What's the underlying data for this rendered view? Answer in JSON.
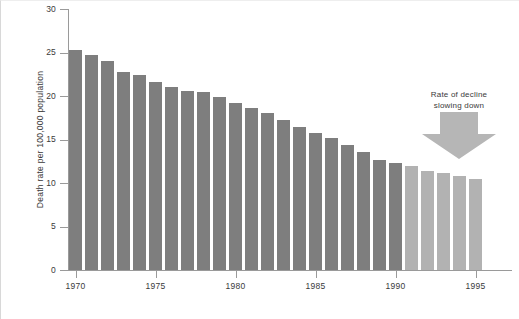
{
  "chart_data": {
    "type": "bar",
    "title": "",
    "xlabel": "",
    "ylabel": "Death rate per 100,000 population",
    "ylim": [
      0,
      30
    ],
    "yticks": [
      0,
      5,
      10,
      15,
      20,
      25,
      30
    ],
    "ytick_labels": [
      "0",
      "5",
      "10",
      "15",
      "20",
      "25",
      "30"
    ],
    "xticks": [
      1970,
      1975,
      1980,
      1985,
      1990,
      1995
    ],
    "xtick_labels": [
      "1970",
      "1975",
      "1980",
      "1985",
      "1990",
      "1995"
    ],
    "grid": false,
    "legend": "none",
    "categories": [
      "1970",
      "1971",
      "1972",
      "1973",
      "1974",
      "1975",
      "1976",
      "1977",
      "1978",
      "1979",
      "1980",
      "1981",
      "1982",
      "1983",
      "1984",
      "1985",
      "1986",
      "1987",
      "1988",
      "1989",
      "1990",
      "1991",
      "1992",
      "1993",
      "1994",
      "1995"
    ],
    "values": [
      25.3,
      24.7,
      24.0,
      22.8,
      22.4,
      21.6,
      21.0,
      20.6,
      20.5,
      19.9,
      19.2,
      18.6,
      18.0,
      17.3,
      16.4,
      15.8,
      15.2,
      14.4,
      13.6,
      12.6,
      12.3,
      11.9,
      11.4,
      11.2,
      10.8,
      10.5
    ],
    "bar_colors": [
      "#7e7e7e",
      "#7e7e7e",
      "#7e7e7e",
      "#7e7e7e",
      "#7e7e7e",
      "#7e7e7e",
      "#7e7e7e",
      "#7e7e7e",
      "#7e7e7e",
      "#7e7e7e",
      "#7e7e7e",
      "#7e7e7e",
      "#7e7e7e",
      "#7e7e7e",
      "#7e7e7e",
      "#7e7e7e",
      "#7e7e7e",
      "#7e7e7e",
      "#7e7e7e",
      "#7e7e7e",
      "#7e7e7e",
      "#b2b2b2",
      "#b2b2b2",
      "#b2b2b2",
      "#b2b2b2",
      "#b2b2b2"
    ],
    "colors": {
      "bar_primary": "#7e7e7e",
      "bar_highlight": "#b2b2b2",
      "axis": "#9a9a9a",
      "text": "#3a3a3a",
      "arrow": "#b6b6b6",
      "background": "#ffffff"
    },
    "annotations": [
      {
        "name": "rate-of-decline-note",
        "line1": "Rate of decline",
        "line2": "slowing down",
        "marker": "down-arrow",
        "points_at": "1991-1995"
      }
    ]
  }
}
